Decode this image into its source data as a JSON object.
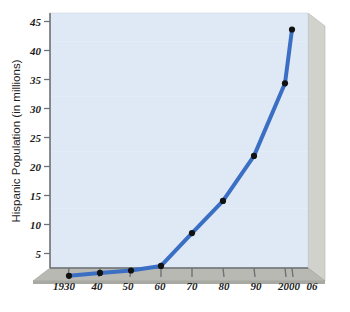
{
  "figure": {
    "kind": "line-chart",
    "background_color": "#ffffff",
    "panel_color": "#dfe9f5",
    "panel_top_edge_color": "#eef3fa",
    "panel_side_color": "#cfcfcb",
    "panel_base_color": "#b9b9b4",
    "axis_color": "#6e7276",
    "line_color": "#3a6fc4",
    "marker_color": "#111111"
  },
  "chart_data": {
    "type": "line",
    "title": "",
    "xlabel": "",
    "ylabel": "Hispanic Population (in millions)",
    "categories": [
      "1930",
      "40",
      "50",
      "60",
      "70",
      "80",
      "90",
      "2000",
      "06"
    ],
    "values": [
      1.4,
      1.9,
      2.3,
      3.1,
      8.7,
      14.2,
      21.9,
      34.3,
      43.5
    ],
    "series": [
      {
        "name": "Hispanic Population (in millions)",
        "values": [
          1.4,
          1.9,
          2.3,
          3.1,
          8.7,
          14.2,
          21.9,
          34.3,
          43.5
        ]
      }
    ],
    "ylim": [
      0,
      47
    ],
    "ytick_labels": [
      "5",
      "10",
      "15",
      "20",
      "25",
      "30",
      "35",
      "40",
      "45"
    ],
    "ytick_values": [
      5,
      10,
      15,
      20,
      25,
      30,
      35,
      40,
      45
    ],
    "xtick_labels": [
      "1930",
      "40",
      "50",
      "60",
      "70",
      "80",
      "90",
      "2000",
      "06"
    ],
    "grid": false,
    "legend": false,
    "legend_position": "none",
    "marker": "circle",
    "line_width": 4
  }
}
